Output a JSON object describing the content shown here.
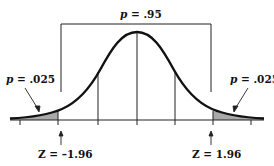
{
  "diagram": {
    "type": "normal-distribution",
    "center_label": {
      "var": "p",
      "eq": " = .95"
    },
    "left_tail_label": {
      "var": "p",
      "eq": " = .025"
    },
    "right_tail_label": {
      "var": "p",
      "eq": " = .025"
    },
    "left_z_label": "Z = –1.96",
    "right_z_label": "Z = 1.96",
    "colors": {
      "line": "#111111",
      "shade": "#a9a9a9"
    }
  }
}
